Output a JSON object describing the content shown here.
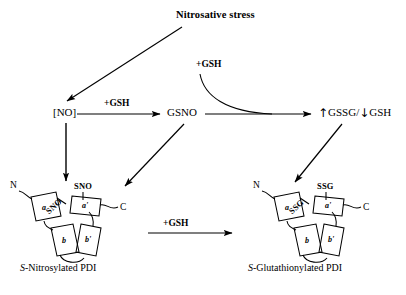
{
  "figure": {
    "title": "Nitrosative stress",
    "background_color": "#ffffff",
    "stroke_color": "#000000"
  },
  "nodes": {
    "no": "[NO]",
    "gsno": "GSNO",
    "glutathione_up": "↑",
    "glutathione_gssg": "GSSG",
    "glutathione_sep": "/",
    "glutathione_down": "↓",
    "glutathione_gsh": "GSH"
  },
  "edges": {
    "no_to_gsno": "+GSH",
    "gsh_curve": "+GSH",
    "pdi_conversion": "+GSH"
  },
  "structures": {
    "left": {
      "caption_italic": "S",
      "caption_rest": "-Nitrosylated PDI",
      "n_terminus": "N",
      "c_terminus": "C",
      "site_a": "SNO",
      "site_a_prime": "SNO",
      "domains": [
        "a",
        "b",
        "b'",
        "a'"
      ]
    },
    "right": {
      "caption_italic": "S",
      "caption_rest": "-Glutathionylated PDI",
      "n_terminus": "N",
      "c_terminus": "C",
      "site_a": "SSG",
      "site_a_prime": "SSG",
      "domains": [
        "a",
        "b",
        "b'",
        "a'"
      ]
    }
  }
}
